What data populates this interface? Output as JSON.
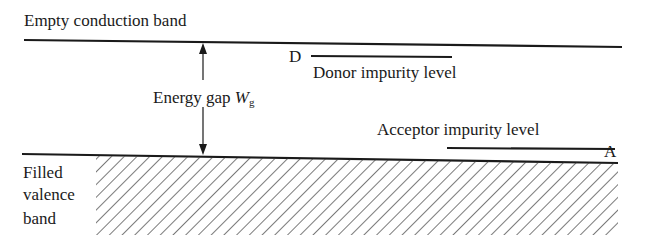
{
  "diagram": {
    "title_conduction": "Empty conduction band",
    "energy_gap_label": "Energy gap",
    "energy_gap_symbol": "W",
    "energy_gap_subscript": "g",
    "donor_marker": "D",
    "donor_label": "Donor impurity level",
    "acceptor_label": "Acceptor impurity level",
    "acceptor_marker": "A",
    "valence_label_line1": "Filled",
    "valence_label_line2": "valence",
    "valence_label_line3": "band",
    "colors": {
      "ink": "#1a1a1a",
      "background": "#ffffff"
    }
  }
}
